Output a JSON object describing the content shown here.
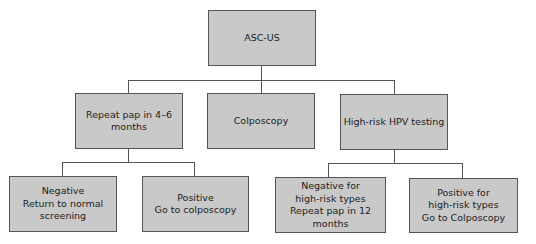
{
  "diagram": {
    "type": "flowchart-tree",
    "root": {
      "id": "asc-us",
      "label": "ASC-US",
      "children": [
        {
          "id": "repeat-pap",
          "label": "Repeat pap in 4–6\nmonths",
          "children": [
            {
              "id": "negative",
              "label": "Negative\nReturn to normal\nscreening"
            },
            {
              "id": "positive",
              "label": "Positive\nGo to colposcopy"
            }
          ]
        },
        {
          "id": "colposcopy",
          "label": "Colposcopy",
          "children": []
        },
        {
          "id": "hpv-testing",
          "label": "High-risk HPV testing",
          "children": [
            {
              "id": "negative-hr",
              "label": "Negative for\nhigh-risk types\nRepeat pap in 12 months"
            },
            {
              "id": "positive-hr",
              "label": "Positive for\nhigh-risk types\nGo to Colposcopy"
            }
          ]
        }
      ]
    }
  },
  "nodes": {
    "root": "ASC-US",
    "repeat_pap": "Repeat pap in 4–6\nmonths",
    "colposcopy": "Colposcopy",
    "hpv_testing": "High-risk HPV testing",
    "negative": "Negative\nReturn to normal\nscreening",
    "positive": "Positive\nGo to colposcopy",
    "negative_hr": "Negative for\nhigh-risk types\nRepeat pap in 12 months",
    "positive_hr": "Positive for\nhigh-risk types\nGo to Colposcopy"
  },
  "colors": {
    "box_fill": "#c9c9c9",
    "box_border": "#555555",
    "connector": "#555555",
    "text": "#222222",
    "background": "#ffffff"
  }
}
